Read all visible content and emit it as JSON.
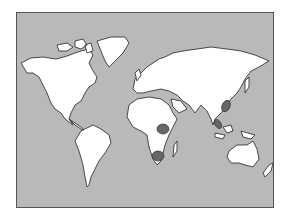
{
  "map": {
    "type": "world-map",
    "colors": {
      "ocean": "#b9b9b9",
      "land": "#ffffff",
      "outline": "#222222",
      "highlight": "#666666",
      "border": "#555555"
    },
    "highlighted_regions": [
      {
        "name": "east-africa",
        "cx": 162,
        "cy": 128
      },
      {
        "name": "southern-africa",
        "cx": 157,
        "cy": 154
      },
      {
        "name": "southern-china",
        "cx": 224,
        "cy": 105
      },
      {
        "name": "malay-peninsula",
        "cx": 217,
        "cy": 123
      }
    ]
  }
}
